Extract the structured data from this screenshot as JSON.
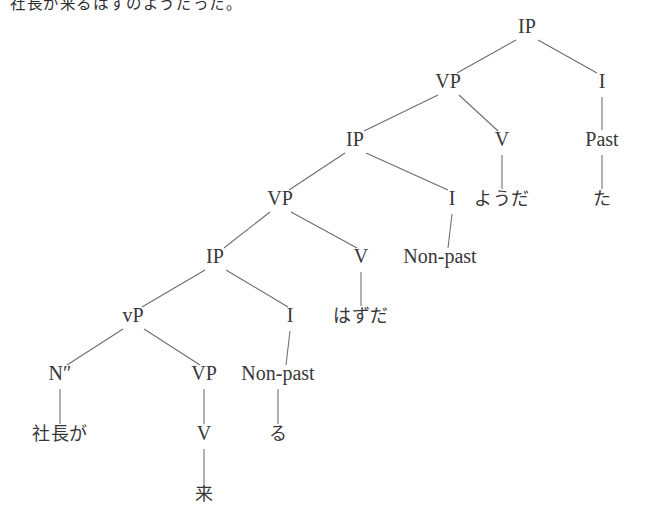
{
  "caption": {
    "text": "社長が来るはずのようだった。"
  },
  "figure": {
    "type": "syntax-tree",
    "line_color": "#6b6b70",
    "text_color": "#37373a",
    "background": "#ffffff"
  },
  "tree": {
    "nodes": [
      {
        "id": "ip1",
        "label": "IP",
        "x": 527,
        "y": 33,
        "kind": "category"
      },
      {
        "id": "vp1",
        "label": "VP",
        "x": 448,
        "y": 88,
        "kind": "category"
      },
      {
        "id": "i1",
        "label": "I",
        "x": 602,
        "y": 88,
        "kind": "category"
      },
      {
        "id": "past",
        "label": "Past",
        "x": 602,
        "y": 146,
        "kind": "feature"
      },
      {
        "id": "ta",
        "label": "た",
        "x": 602,
        "y": 205,
        "kind": "terminal"
      },
      {
        "id": "ip2",
        "label": "IP",
        "x": 355,
        "y": 146,
        "kind": "category"
      },
      {
        "id": "v1",
        "label": "V",
        "x": 502,
        "y": 146,
        "kind": "category"
      },
      {
        "id": "youda",
        "label": "ようだ",
        "x": 502,
        "y": 205,
        "kind": "terminal"
      },
      {
        "id": "vp2",
        "label": "VP",
        "x": 280,
        "y": 205,
        "kind": "category"
      },
      {
        "id": "i2",
        "label": "I",
        "x": 452,
        "y": 205,
        "kind": "category"
      },
      {
        "id": "np1",
        "label": "Non-past",
        "x": 440,
        "y": 263,
        "kind": "feature"
      },
      {
        "id": "ip3",
        "label": "IP",
        "x": 215,
        "y": 263,
        "kind": "category"
      },
      {
        "id": "v2",
        "label": "V",
        "x": 361,
        "y": 263,
        "kind": "category"
      },
      {
        "id": "hazuda",
        "label": "はずだ",
        "x": 361,
        "y": 322,
        "kind": "terminal"
      },
      {
        "id": "vp3",
        "label": "vP",
        "x": 133,
        "y": 322,
        "kind": "category"
      },
      {
        "id": "i3",
        "label": "I",
        "x": 290,
        "y": 322,
        "kind": "category"
      },
      {
        "id": "np2",
        "label": "Non-past",
        "x": 278,
        "y": 380,
        "kind": "feature"
      },
      {
        "id": "n2",
        "label": "N″",
        "x": 60,
        "y": 380,
        "kind": "category"
      },
      {
        "id": "vp4",
        "label": "VP",
        "x": 204,
        "y": 380,
        "kind": "category"
      },
      {
        "id": "ru",
        "label": "る",
        "x": 278,
        "y": 440,
        "kind": "terminal"
      },
      {
        "id": "shacho",
        "label": "社長が",
        "x": 60,
        "y": 440,
        "kind": "terminal"
      },
      {
        "id": "v3",
        "label": "V",
        "x": 204,
        "y": 440,
        "kind": "category"
      },
      {
        "id": "kuru",
        "label": "来",
        "x": 204,
        "y": 500,
        "kind": "terminal"
      }
    ],
    "edges": [
      {
        "from": "ip1",
        "to": "vp1",
        "x1": 516,
        "y1": 40,
        "x2": 457,
        "y2": 73
      },
      {
        "from": "ip1",
        "to": "i1",
        "x1": 538,
        "y1": 40,
        "x2": 597,
        "y2": 73
      },
      {
        "from": "i1",
        "to": "past",
        "x1": 602,
        "y1": 97,
        "x2": 602,
        "y2": 130
      },
      {
        "from": "past",
        "to": "ta",
        "x1": 602,
        "y1": 155,
        "x2": 602,
        "y2": 189
      },
      {
        "from": "vp1",
        "to": "ip2",
        "x1": 438,
        "y1": 95,
        "x2": 364,
        "y2": 131
      },
      {
        "from": "vp1",
        "to": "v1",
        "x1": 459,
        "y1": 95,
        "x2": 498,
        "y2": 131
      },
      {
        "from": "v1",
        "to": "youda",
        "x1": 502,
        "y1": 155,
        "x2": 502,
        "y2": 189
      },
      {
        "from": "ip2",
        "to": "vp2",
        "x1": 345,
        "y1": 153,
        "x2": 289,
        "y2": 190
      },
      {
        "from": "ip2",
        "to": "i2",
        "x1": 366,
        "y1": 153,
        "x2": 448,
        "y2": 190
      },
      {
        "from": "i2",
        "to": "np1",
        "x1": 452,
        "y1": 214,
        "x2": 448,
        "y2": 248
      },
      {
        "from": "vp2",
        "to": "ip3",
        "x1": 270,
        "y1": 212,
        "x2": 224,
        "y2": 248
      },
      {
        "from": "vp2",
        "to": "v2",
        "x1": 291,
        "y1": 212,
        "x2": 357,
        "y2": 248
      },
      {
        "from": "v2",
        "to": "hazuda",
        "x1": 361,
        "y1": 272,
        "x2": 361,
        "y2": 306
      },
      {
        "from": "ip3",
        "to": "vp3",
        "x1": 205,
        "y1": 270,
        "x2": 142,
        "y2": 307
      },
      {
        "from": "ip3",
        "to": "i3",
        "x1": 226,
        "y1": 270,
        "x2": 288,
        "y2": 307
      },
      {
        "from": "i3",
        "to": "np2",
        "x1": 290,
        "y1": 331,
        "x2": 286,
        "y2": 365
      },
      {
        "from": "vp3",
        "to": "n2",
        "x1": 123,
        "y1": 329,
        "x2": 67,
        "y2": 365
      },
      {
        "from": "vp3",
        "to": "vp4",
        "x1": 144,
        "y1": 329,
        "x2": 200,
        "y2": 365
      },
      {
        "from": "np2",
        "to": "ru",
        "x1": 278,
        "y1": 389,
        "x2": 278,
        "y2": 424
      },
      {
        "from": "n2",
        "to": "shacho",
        "x1": 60,
        "y1": 389,
        "x2": 60,
        "y2": 424
      },
      {
        "from": "vp4",
        "to": "v3",
        "x1": 204,
        "y1": 389,
        "x2": 204,
        "y2": 424
      },
      {
        "from": "v3",
        "to": "kuru",
        "x1": 204,
        "y1": 449,
        "x2": 204,
        "y2": 484
      }
    ]
  }
}
